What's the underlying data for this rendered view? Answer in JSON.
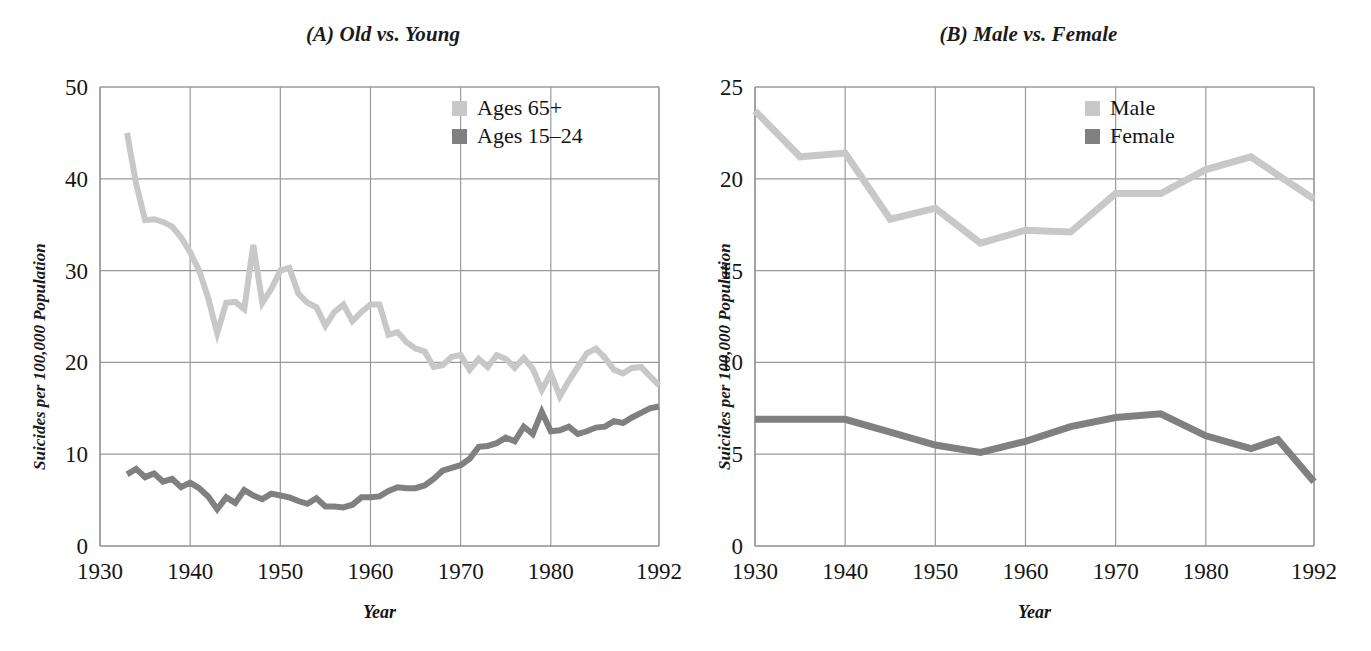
{
  "figure": {
    "background": "#ffffff",
    "panels": [
      "A",
      "B"
    ]
  },
  "panel_a": {
    "title": "(A) Old vs. Young",
    "ylabel": "Suicides per 100,000 Population",
    "xlabel": "Year",
    "yticks": [
      "0",
      "10",
      "20",
      "30",
      "40",
      "50"
    ],
    "xticks": [
      "1930",
      "1940",
      "1950",
      "1960",
      "1970",
      "1980",
      "1992"
    ],
    "legend": [
      {
        "label": "Ages 65+",
        "color": "#c8c8c8"
      },
      {
        "label": "Ages 15–24",
        "color": "#808080"
      }
    ]
  },
  "panel_b": {
    "title": "(B) Male vs. Female",
    "ylabel": "Suicides per 100,000 Population",
    "xlabel": "Year",
    "yticks": [
      "0",
      "5",
      "10",
      "15",
      "20",
      "25"
    ],
    "xticks": [
      "1930",
      "1940",
      "1950",
      "1960",
      "1970",
      "1980",
      "1992"
    ],
    "legend": [
      {
        "label": "Male",
        "color": "#c8c8c8"
      },
      {
        "label": "Female",
        "color": "#808080"
      }
    ]
  },
  "chart_data": [
    {
      "type": "line",
      "panel": "A",
      "title": "(A) Old vs. Young",
      "xlabel": "Year",
      "ylabel": "Suicides per 100,000 Population",
      "xlim": [
        1930,
        1992
      ],
      "ylim": [
        0,
        50
      ],
      "xticks": [
        1930,
        1940,
        1950,
        1960,
        1970,
        1980,
        1992
      ],
      "yticks": [
        0,
        10,
        20,
        30,
        40,
        50
      ],
      "grid": true,
      "legend_position": "top-right",
      "series": [
        {
          "name": "Ages 65+",
          "color": "#c8c8c8",
          "x": [
            1933,
            1934,
            1935,
            1936,
            1937,
            1938,
            1939,
            1940,
            1941,
            1942,
            1943,
            1944,
            1945,
            1946,
            1947,
            1948,
            1949,
            1950,
            1951,
            1952,
            1953,
            1954,
            1955,
            1956,
            1957,
            1958,
            1959,
            1960,
            1961,
            1962,
            1963,
            1964,
            1965,
            1966,
            1967,
            1968,
            1969,
            1970,
            1971,
            1972,
            1973,
            1974,
            1975,
            1976,
            1977,
            1978,
            1979,
            1980,
            1981,
            1982,
            1983,
            1984,
            1985,
            1986,
            1987,
            1988,
            1989,
            1990,
            1991,
            1992
          ],
          "values": [
            45.0,
            39.5,
            35.5,
            35.6,
            35.3,
            34.8,
            33.6,
            32.0,
            30.0,
            27.0,
            23.2,
            26.5,
            26.6,
            25.8,
            32.8,
            26.5,
            28.0,
            30.0,
            30.3,
            27.5,
            26.5,
            26.0,
            24.0,
            25.5,
            26.3,
            24.5,
            25.5,
            26.3,
            26.3,
            23.0,
            23.3,
            22.2,
            21.5,
            21.2,
            19.5,
            19.7,
            20.6,
            20.8,
            19.2,
            20.4,
            19.5,
            20.8,
            20.4,
            19.4,
            20.5,
            19.3,
            17.0,
            18.8,
            16.3,
            18.0,
            19.5,
            21.0,
            21.5,
            20.5,
            19.2,
            18.8,
            19.4,
            19.5,
            18.5,
            17.5
          ]
        },
        {
          "name": "Ages 15–24",
          "color": "#808080",
          "x": [
            1933,
            1934,
            1935,
            1936,
            1937,
            1938,
            1939,
            1940,
            1941,
            1942,
            1943,
            1944,
            1945,
            1946,
            1947,
            1948,
            1949,
            1950,
            1951,
            1952,
            1953,
            1954,
            1955,
            1956,
            1957,
            1958,
            1959,
            1960,
            1961,
            1962,
            1963,
            1964,
            1965,
            1966,
            1967,
            1968,
            1969,
            1970,
            1971,
            1972,
            1973,
            1974,
            1975,
            1976,
            1977,
            1978,
            1979,
            1980,
            1981,
            1982,
            1983,
            1984,
            1985,
            1986,
            1987,
            1988,
            1989,
            1990,
            1991,
            1992
          ],
          "values": [
            7.8,
            8.4,
            7.5,
            7.9,
            7.0,
            7.3,
            6.4,
            6.9,
            6.3,
            5.4,
            4.0,
            5.3,
            4.7,
            6.1,
            5.5,
            5.1,
            5.7,
            5.5,
            5.3,
            4.9,
            4.6,
            5.2,
            4.3,
            4.3,
            4.2,
            4.5,
            5.3,
            5.3,
            5.4,
            6.0,
            6.4,
            6.3,
            6.3,
            6.6,
            7.3,
            8.2,
            8.5,
            8.8,
            9.5,
            10.8,
            10.9,
            11.2,
            11.8,
            11.4,
            13.0,
            12.2,
            14.6,
            12.5,
            12.6,
            13.0,
            12.2,
            12.5,
            12.9,
            13.0,
            13.6,
            13.4,
            14.0,
            14.5,
            15.0,
            15.2
          ]
        }
      ]
    },
    {
      "type": "line",
      "panel": "B",
      "title": "(B) Male vs. Female",
      "xlabel": "Year",
      "ylabel": "Suicides per 100,000 Population",
      "xlim": [
        1930,
        1992
      ],
      "ylim": [
        0,
        25
      ],
      "xticks": [
        1930,
        1940,
        1950,
        1960,
        1970,
        1980,
        1992
      ],
      "yticks": [
        0,
        5,
        10,
        15,
        20,
        25
      ],
      "grid": true,
      "legend_position": "top-right",
      "series": [
        {
          "name": "Male",
          "color": "#c8c8c8",
          "x": [
            1930,
            1935,
            1940,
            1945,
            1950,
            1955,
            1960,
            1965,
            1970,
            1975,
            1980,
            1985,
            1988,
            1992
          ],
          "values": [
            23.7,
            21.2,
            21.4,
            17.8,
            18.4,
            16.5,
            17.2,
            17.1,
            19.2,
            19.2,
            20.5,
            21.2,
            20.2,
            18.9
          ]
        },
        {
          "name": "Female",
          "color": "#808080",
          "x": [
            1930,
            1935,
            1940,
            1945,
            1950,
            1955,
            1960,
            1965,
            1970,
            1975,
            1980,
            1985,
            1988,
            1992
          ],
          "values": [
            6.9,
            6.9,
            6.9,
            6.2,
            5.5,
            5.1,
            5.7,
            6.5,
            7.0,
            7.2,
            6.0,
            5.3,
            5.8,
            3.5
          ]
        }
      ]
    }
  ]
}
